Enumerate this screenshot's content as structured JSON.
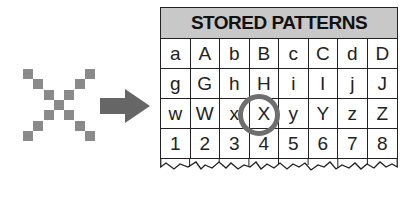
{
  "diagram": {
    "input_pattern": {
      "label": "X",
      "icon": "pixel-x-icon",
      "pixel_color": "#8a8a8a",
      "pixels": [
        [
          0,
          0
        ],
        [
          6,
          0
        ],
        [
          1,
          1
        ],
        [
          5,
          1
        ],
        [
          2,
          2
        ],
        [
          4,
          2
        ],
        [
          3,
          3
        ],
        [
          2,
          4
        ],
        [
          4,
          4
        ],
        [
          1,
          5
        ],
        [
          5,
          5
        ],
        [
          0,
          6
        ],
        [
          6,
          6
        ]
      ]
    },
    "arrow": {
      "icon": "right-arrow-icon",
      "color": "#666666"
    },
    "table": {
      "title": "STORED PATTERNS",
      "header_color": "#c8c8c8",
      "rows": [
        [
          "a",
          "A",
          "b",
          "B",
          "c",
          "C",
          "d",
          "D"
        ],
        [
          "g",
          "G",
          "h",
          "H",
          "i",
          "I",
          "j",
          "J"
        ],
        [
          "w",
          "W",
          "x",
          "X",
          "y",
          "Y",
          "z",
          "Z"
        ],
        [
          "1",
          "2",
          "3",
          "4",
          "5",
          "6",
          "7",
          "8"
        ]
      ],
      "highlighted": {
        "row": 2,
        "col": 3,
        "value": "X",
        "marker": "circle",
        "color": "#6e6e6e"
      }
    }
  }
}
